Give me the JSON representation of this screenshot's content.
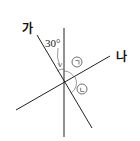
{
  "diagram": {
    "type": "intersecting-lines-angle-figure",
    "lines": [
      {
        "name": "vertical",
        "label": ""
      },
      {
        "name": "line-ga",
        "label": "가"
      },
      {
        "name": "line-na",
        "label": "나"
      }
    ],
    "angle_given": {
      "value": 30,
      "text": "30°",
      "between": [
        "line-ga",
        "vertical"
      ]
    },
    "angle_marks": [
      {
        "symbol": "㉠",
        "glyph": "ㄱ"
      },
      {
        "symbol": "㉡",
        "glyph": "ㄴ"
      }
    ]
  }
}
